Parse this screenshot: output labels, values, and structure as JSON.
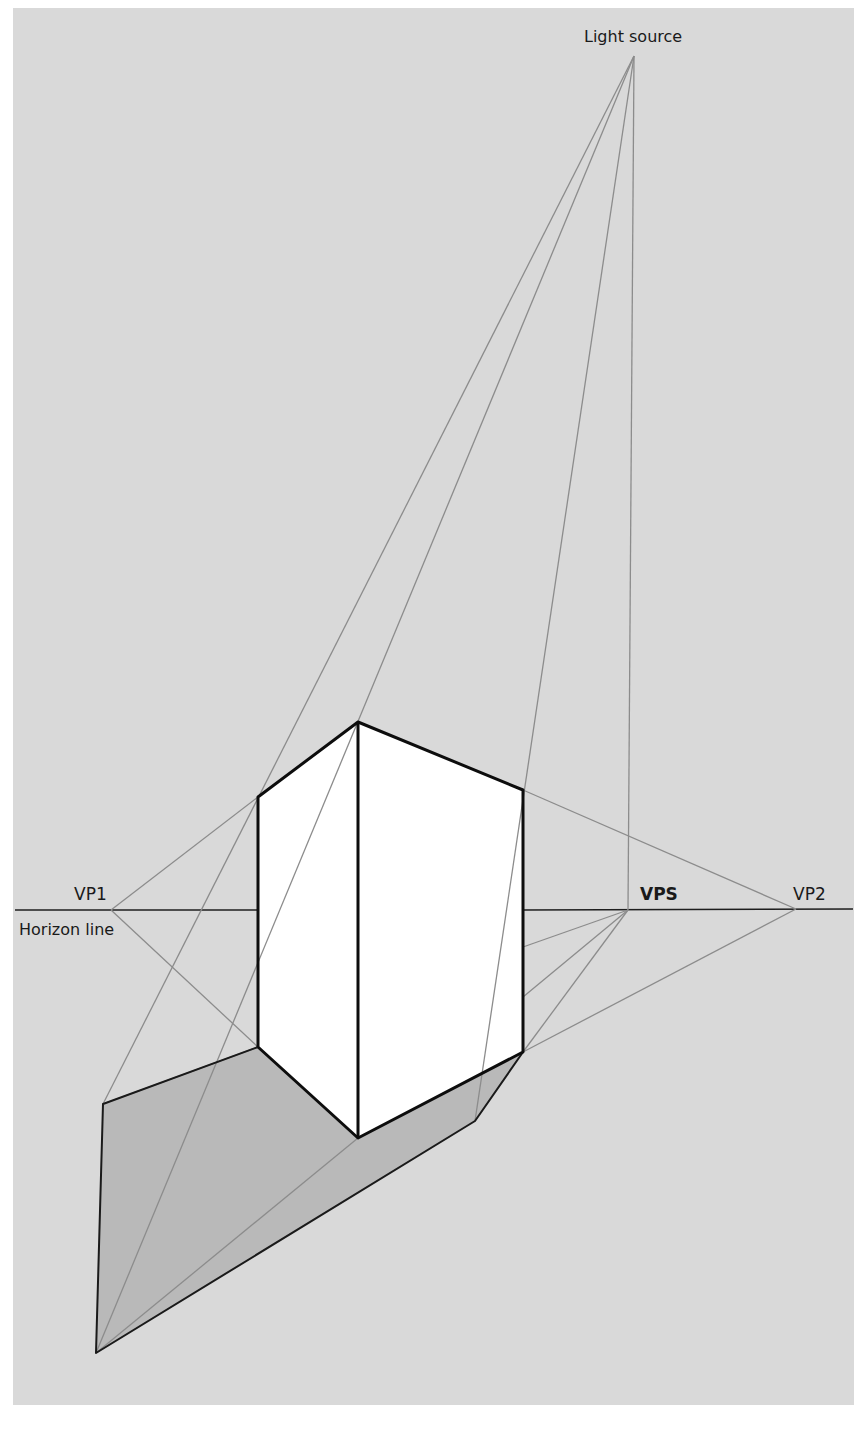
{
  "diagram": {
    "type": "two-point perspective shadow construction",
    "colors": {
      "background": "#d9d9d9",
      "shadow": "#b9b9b9",
      "box_face": "#ffffff",
      "construction_line": "#8c8c8c",
      "edge": "#0d0d0d"
    },
    "labels": {
      "light_source": "Light source",
      "vp1": "VP1",
      "vp2": "VP2",
      "vps": "VPS",
      "horizon_line": "Horizon line"
    },
    "points": {
      "light_source": [
        634,
        56
      ],
      "vp1": [
        111,
        910
      ],
      "vps": [
        628,
        910
      ],
      "vp2": [
        796,
        909
      ],
      "box_front_top": [
        358,
        722
      ],
      "box_left_top": [
        258,
        797
      ],
      "box_right_top": [
        523,
        790
      ],
      "box_front_bottom": [
        358,
        1138
      ],
      "box_left_bottom": [
        258,
        1047
      ],
      "box_right_bottom": [
        523,
        1052
      ],
      "shadow_left": [
        103,
        1104
      ],
      "shadow_tip": [
        96,
        1353
      ],
      "shadow_right": [
        475,
        1121
      ]
    }
  }
}
